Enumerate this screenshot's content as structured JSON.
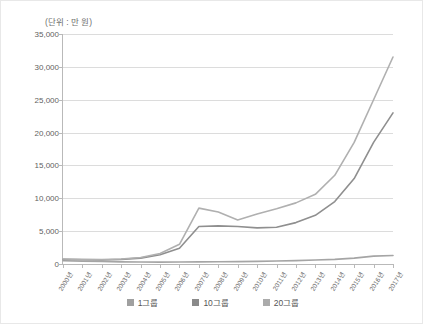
{
  "unit_label": "(단위 : 만 원)",
  "legend": {
    "items": [
      {
        "label": "1그룹",
        "color": "#a0a0a0"
      },
      {
        "label": "10그룹",
        "color": "#8a8a8a"
      },
      {
        "label": "20그룹",
        "color": "#ababab"
      }
    ]
  },
  "chart_data": {
    "type": "line",
    "title": "",
    "subtitle": "",
    "xlabel": "",
    "ylabel": "(단위 : 만 원)",
    "ylim": [
      0,
      35000
    ],
    "ytick_labels": [
      "35,000",
      "30,000",
      "25,000",
      "20,000",
      "15,000",
      "10,000",
      "5,000",
      "0"
    ],
    "ytick_values": [
      35000,
      30000,
      25000,
      20000,
      15000,
      10000,
      5000,
      0
    ],
    "grid": true,
    "legend_position": "bottom",
    "categories": [
      "2000년",
      "2001년",
      "2002년",
      "2003년",
      "2004년",
      "2005년",
      "2006년",
      "2007년",
      "2008년",
      "2009년",
      "2010년",
      "2011년",
      "2012년",
      "2013년",
      "2014년",
      "2015년",
      "2016년",
      "2017년"
    ],
    "series": [
      {
        "name": "1그룹",
        "color": "#a5a5a5",
        "values": [
          500,
          420,
          380,
          330,
          300,
          290,
          300,
          320,
          340,
          360,
          400,
          450,
          520,
          600,
          700,
          900,
          1200,
          1300
        ]
      },
      {
        "name": "10그룹",
        "color": "#8f8f8f",
        "values": [
          700,
          650,
          620,
          700,
          900,
          1400,
          2400,
          5700,
          5800,
          5700,
          5500,
          5600,
          6300,
          7400,
          9500,
          13000,
          18500,
          23000
        ]
      },
      {
        "name": "20그룹",
        "color": "#b0b0b0",
        "values": [
          750,
          700,
          680,
          760,
          1000,
          1600,
          3000,
          8500,
          7900,
          6700,
          7600,
          8400,
          9300,
          10600,
          13500,
          18500,
          25000,
          31500
        ]
      }
    ]
  }
}
